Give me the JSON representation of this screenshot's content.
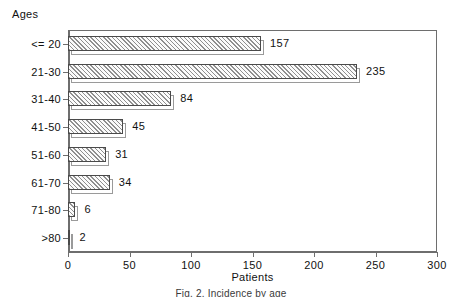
{
  "chart_data": {
    "type": "bar",
    "orientation": "horizontal",
    "title": "Ages",
    "xlabel": "Patients",
    "ylabel": "Ages",
    "categories": [
      "<= 20",
      "21-30",
      "31-40",
      "41-50",
      "51-60",
      "61-70",
      "71-80",
      ">80"
    ],
    "values": [
      157,
      235,
      84,
      45,
      31,
      34,
      6,
      2
    ],
    "value_labels": [
      "157",
      "235",
      "84",
      "45",
      "31",
      "34",
      "6",
      "2"
    ],
    "xlim": [
      0,
      300
    ],
    "xticks": [
      0,
      50,
      100,
      150,
      200,
      250,
      300
    ],
    "xtick_labels": [
      "0",
      "50",
      "100",
      "150",
      "200",
      "250",
      "300"
    ],
    "grid": false,
    "legend": false,
    "bar_style": "hatched-3d",
    "colors": {
      "bar_fill": "#fbfbfb",
      "bar_hatch": "#8f8f8f",
      "bar_outline": "#4a4a4a",
      "bar_shadow": "#9a9a9a",
      "axis": "#6e6e6e",
      "text": "#111111",
      "background": "#ffffff"
    }
  },
  "caption": {
    "text": "Fig. 2. Incidence by age"
  }
}
